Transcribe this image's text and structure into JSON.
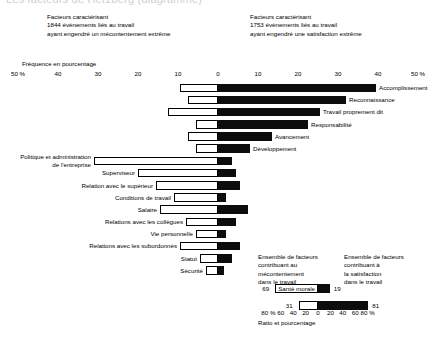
{
  "title": "Les facteurs de Herzberg (diagramme)",
  "header": {
    "left": [
      "Facteurs caractérisant",
      "1844 évènements liés au travail",
      "ayant engendré un mécontentement extrême"
    ],
    "right": [
      "Facteurs caractérisant",
      "1753 évènements liés au travail",
      "ayant engendré une satisfaction extrême"
    ]
  },
  "frequency_axis_label": "Fréquence en pourcentage",
  "ratio_axis_label": "Ratio et pourcentage",
  "legend": {
    "left": [
      "Ensemble de facteurs",
      "contribuant au",
      "mécontentement",
      "dans le travail"
    ],
    "right": [
      "Ensemble de facteurs",
      "contribuant à",
      "la satisfaction",
      "dans le travail"
    ],
    "bars": [
      {
        "caption": "Santé morale",
        "left_value": "69",
        "right_value": "19",
        "left_pct": 69,
        "right_pct": 19
      },
      {
        "caption": "",
        "left_value": "31",
        "right_value": "81",
        "left_pct": 31,
        "right_pct": 81
      }
    ]
  },
  "chart_data": {
    "type": "bar",
    "title": "Les facteurs de Herzberg (diagramme)",
    "xlabel": "Fréquence en pourcentage",
    "ylabel": "",
    "orientation": "horizontal",
    "layout": "diverging-bidirectional",
    "xlim": [
      -50,
      50
    ],
    "grid": false,
    "legend_position": "bottom-right",
    "axis_ticks": [
      "50 %",
      "40",
      "30",
      "20",
      "10",
      "0",
      "10",
      "20",
      "30",
      "40",
      "50 %"
    ],
    "axis_tick_values": [
      -50,
      -40,
      -30,
      -20,
      -10,
      0,
      10,
      20,
      30,
      40,
      50
    ],
    "series": [
      {
        "name": "Mécontentement (insatisfaction)",
        "color": "#ffffff",
        "side": "left"
      },
      {
        "name": "Satisfaction",
        "color": "#000000",
        "side": "right"
      }
    ],
    "categories": [
      "Accomplissement",
      "Reconnaissance",
      "Travail proprement dit",
      "Responsabilité",
      "Avancement",
      "Développement",
      "Politique et administration\nde l'entreprise",
      "Superviseur",
      "Relation avec le supérieur",
      "Conditions de travail",
      "Salaire",
      "Relations avec les collègues",
      "Vie personnelle",
      "Relations avec les subordonnés",
      "Statut",
      "Sécurité"
    ],
    "dissatisfaction_values": [
      9.5,
      7.5,
      12.5,
      5.5,
      7.5,
      5.5,
      31.0,
      20.0,
      15.5,
      11.0,
      14.5,
      8.0,
      5.5,
      9.5,
      4.5,
      3.0
    ],
    "satisfaction_values": [
      39.5,
      32.0,
      25.5,
      22.5,
      13.5,
      8.0,
      3.5,
      4.5,
      5.5,
      2.0,
      7.5,
      4.5,
      2.0,
      5.5,
      3.5,
      1.5
    ],
    "label_side": [
      "right",
      "right",
      "right",
      "right",
      "right",
      "right",
      "left",
      "left",
      "left",
      "left",
      "left",
      "left",
      "left",
      "left",
      "left",
      "left"
    ]
  },
  "bottom_axis": {
    "ticks": [
      "80 %",
      "60",
      "40",
      "20",
      "0",
      "20",
      "40",
      "60",
      "80 %"
    ],
    "values": [
      -80,
      -60,
      -40,
      -20,
      0,
      20,
      40,
      60,
      80
    ]
  }
}
